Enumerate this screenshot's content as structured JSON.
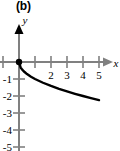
{
  "figure": {
    "panel_label": "(b)",
    "colors": {
      "axis": "#808080",
      "curve": "#000000",
      "text": "#000000",
      "background": "#ffffff"
    }
  },
  "chart_data": {
    "type": "line",
    "title": "(b)",
    "xlabel": "x",
    "ylabel": "y",
    "xlim": [
      -1.2,
      6.2
    ],
    "ylim": [
      -5.6,
      1.4
    ],
    "grid": false,
    "legend": null,
    "x_ticks": [
      -1,
      1,
      2,
      3,
      4,
      5
    ],
    "x_tick_labels": [
      "",
      "",
      "2",
      "3",
      "4",
      "5"
    ],
    "y_ticks": [
      -1,
      -2,
      -3,
      -4,
      -5
    ],
    "y_tick_labels": [
      "-1",
      "-2",
      "-3",
      "-4",
      "-5"
    ],
    "annotations": [
      {
        "name": "origin-point",
        "x": 0,
        "y": 0,
        "marker": "filled-circle"
      }
    ],
    "series": [
      {
        "name": "curve",
        "x": [
          0.0,
          0.1,
          0.2,
          0.35,
          0.5,
          0.75,
          1.0,
          1.5,
          2.0,
          2.5,
          3.0,
          3.5,
          4.0,
          4.5,
          5.0
        ],
        "y": [
          0.0,
          -0.32,
          -0.45,
          -0.59,
          -0.71,
          -0.87,
          -1.0,
          -1.22,
          -1.41,
          -1.58,
          -1.73,
          -1.87,
          -2.0,
          -2.12,
          -2.24
        ]
      }
    ]
  }
}
